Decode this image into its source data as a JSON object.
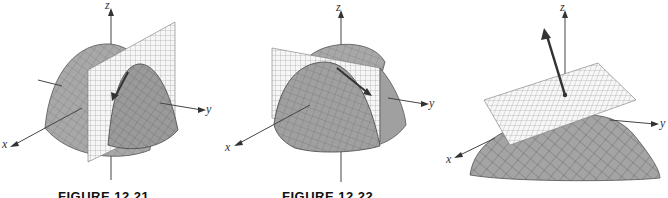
{
  "figures": [
    {
      "id": "a",
      "caption": "FIGURE 12.21",
      "axes": {
        "x": "x",
        "y": "y",
        "z": "z"
      },
      "description": "Paraboloid cap intersected by a vertical plane; tangent arrow along intersection curve"
    },
    {
      "id": "b",
      "caption": "FIGURE 12.22",
      "axes": {
        "x": "x",
        "y": "y",
        "z": "z"
      },
      "description": "Paraboloid cap with vertical plane slicing it; tangent arrow along slice"
    },
    {
      "id": "c",
      "caption": "",
      "axes": {
        "x": "x",
        "y": "y",
        "z": "z"
      },
      "description": "Surface with tangent plane and normal vector arrow"
    }
  ],
  "colors": {
    "surface": "#a8a8a8",
    "surface_dark": "#8c8c8c",
    "mesh": "#4a4a4a",
    "plane": "#f6f6f6",
    "plane_grid": "#8a8a8a",
    "axis": "#444444",
    "arrow": "#333333"
  }
}
